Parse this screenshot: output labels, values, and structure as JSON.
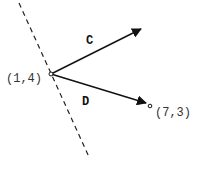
{
  "diagram": {
    "dashed_line": {
      "x1": 19,
      "y1": 3,
      "x2": 89,
      "y2": 157,
      "color": "#222222"
    },
    "origin_point": {
      "label": "(1,4)",
      "x": 51,
      "y": 74
    },
    "target_point": {
      "label": "(7,3)",
      "x": 150,
      "y": 106
    },
    "vectors": [
      {
        "name": "C",
        "label": "C",
        "x1": 51,
        "y1": 74,
        "x2": 132,
        "y2": 34,
        "label_x": 86,
        "label_y": 44
      },
      {
        "name": "D",
        "label": "D",
        "x1": 51,
        "y1": 74,
        "x2": 146,
        "y2": 103,
        "label_x": 82,
        "label_y": 105
      }
    ],
    "stroke_color": "#111111"
  }
}
